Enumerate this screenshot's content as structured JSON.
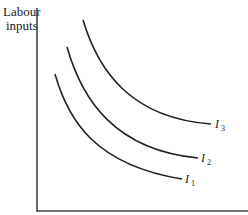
{
  "diagram": {
    "type": "indifference-curves",
    "y_axis_label_line1": "Labour",
    "y_axis_label_line2": "inputs",
    "x_axis_label": "",
    "curves": [
      {
        "name": "I",
        "subscript": "1"
      },
      {
        "name": "I",
        "subscript": "2"
      },
      {
        "name": "I",
        "subscript": "3"
      }
    ],
    "colors": {
      "line": "#222222",
      "axis": "#444444",
      "background": "#ffffff"
    }
  }
}
